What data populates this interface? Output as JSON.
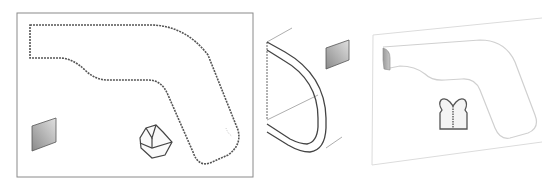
{
  "diagram": {
    "panels": [
      {
        "id": "panel-1",
        "description": "flat outline view with dashed contour, gray square and gem shape"
      },
      {
        "id": "panel-2",
        "description": "isometric side profile of curved channel with gray square"
      },
      {
        "id": "panel-3",
        "description": "faded isometric outline with gray tab and vest icon"
      }
    ],
    "colors": {
      "outline": "#555555",
      "frame": "#888888",
      "fill_gray_dark": "#8a8a8a",
      "fill_gray_light": "#d8d8d8",
      "faded": "#d0d0d0"
    }
  }
}
